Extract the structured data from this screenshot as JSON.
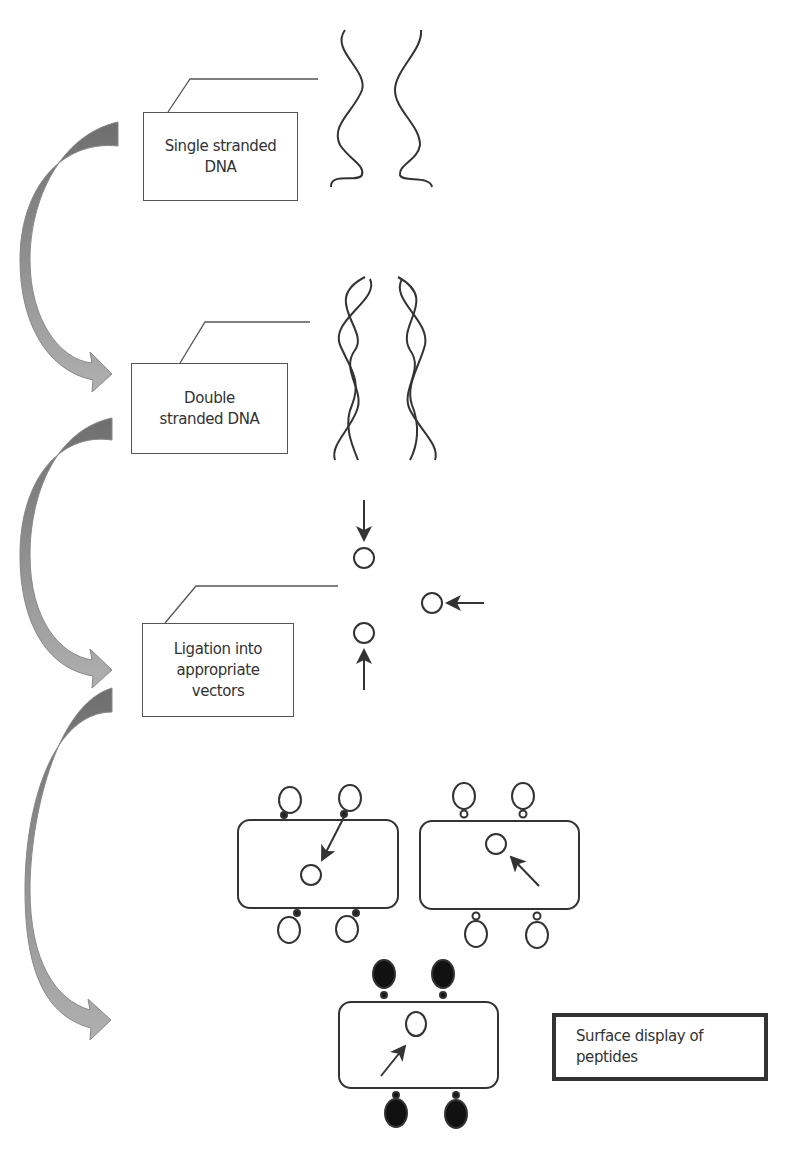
{
  "diagram": {
    "type": "flow",
    "steps": [
      {
        "id": "ssdna",
        "label_lines": [
          "Single stranded",
          "DNA"
        ]
      },
      {
        "id": "dsdna",
        "label_lines": [
          "Double",
          "stranded DNA"
        ]
      },
      {
        "id": "ligation",
        "label_lines": [
          "Ligation into",
          "appropriate",
          "vectors"
        ]
      },
      {
        "id": "display",
        "label_lines": [
          "Surface display of",
          "peptides"
        ]
      }
    ],
    "colors": {
      "flow_arrow_dark": "#6e6e6e",
      "flow_arrow_light": "#a8a8a8",
      "stroke": "#333333",
      "peptide_fill": "#111111"
    }
  }
}
